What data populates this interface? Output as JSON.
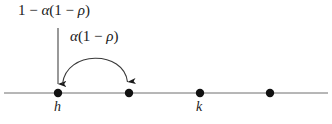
{
  "figure": {
    "type": "number-line-transition-diagram",
    "background_color": "#ffffff",
    "line_color": "#666666",
    "ink_color": "#1a1a1a",
    "axis": {
      "x_start": 4,
      "x_end": 328,
      "y": 93
    },
    "nodes": [
      {
        "id": "node-1",
        "x": 58,
        "y": 93,
        "radius": 4.2,
        "label": "h"
      },
      {
        "id": "node-2",
        "x": 129,
        "y": 93,
        "radius": 4.2,
        "label": ""
      },
      {
        "id": "node-3",
        "x": 200,
        "y": 93,
        "radius": 4.2,
        "label": "k"
      },
      {
        "id": "node-4",
        "x": 270,
        "y": 93,
        "radius": 4.2,
        "label": ""
      }
    ],
    "node_labels": {
      "h": "h",
      "k": "k"
    },
    "arrows": [
      {
        "id": "vertical-arrow",
        "kind": "straight",
        "from": {
          "x": 58,
          "y": 28
        },
        "to": {
          "x": 58,
          "y": 86
        },
        "label": "1 − α(1 − ρ)"
      },
      {
        "id": "arc-arrow",
        "kind": "arc",
        "from": {
          "x": 62,
          "y": 86
        },
        "to": {
          "x": 128,
          "y": 86
        },
        "apex_y": 49,
        "label": "α(1 − ρ)"
      }
    ],
    "labels": {
      "stay_probability": {
        "text": "1 − α(1 − ρ)",
        "parts": [
          {
            "text": "1",
            "style": "upright"
          },
          {
            "text": " − ",
            "style": "upright"
          },
          {
            "text": "α",
            "style": "italic"
          },
          {
            "text": "(1 − ",
            "style": "upright"
          },
          {
            "text": "ρ",
            "style": "italic"
          },
          {
            "text": ")",
            "style": "upright"
          }
        ]
      },
      "move_probability": {
        "text": "α(1 − ρ)",
        "parts": [
          {
            "text": "α",
            "style": "italic"
          },
          {
            "text": "(1 − ",
            "style": "upright"
          },
          {
            "text": "ρ",
            "style": "italic"
          },
          {
            "text": ")",
            "style": "upright"
          }
        ]
      }
    }
  }
}
